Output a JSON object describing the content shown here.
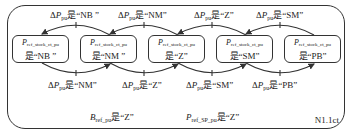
{
  "diagram": {
    "frame_id": "N1.1ct",
    "state_variable": {
      "symbol": "P",
      "subscript": "ref_stock_ct_pu"
    },
    "states": [
      {
        "prefix": "是",
        "value": "“NB ”"
      },
      {
        "prefix": "是",
        "value": "“NM ”"
      },
      {
        "prefix": "是",
        "value": "“Z”"
      },
      {
        "prefix": "是",
        "value": "“SM”"
      },
      {
        "prefix": "是",
        "value": "“PB”"
      }
    ],
    "condition_variable": {
      "delta": "Δ",
      "symbol": "P",
      "subscript": "pu"
    },
    "top_transitions": [
      {
        "from": 1,
        "to": 0,
        "condition": "是“NB ”"
      },
      {
        "from": 2,
        "to": 1,
        "condition": "是“NM”"
      },
      {
        "from": 3,
        "to": 2,
        "condition": "是“Z”"
      },
      {
        "from": 4,
        "to": 3,
        "condition": "是“SM”"
      }
    ],
    "bottom_transitions": [
      {
        "from": 0,
        "to": 1,
        "condition": "是“NM”"
      },
      {
        "from": 1,
        "to": 2,
        "condition": "是“Z”"
      },
      {
        "from": 2,
        "to": 3,
        "condition": "是“SM”"
      },
      {
        "from": 3,
        "to": 4,
        "condition": "是“PB”"
      }
    ],
    "global_conditions": [
      {
        "symbol": "B",
        "subscript": "ref_pu",
        "text": "是“Z”"
      },
      {
        "symbol": "P",
        "subscript": "ref_SP_pu",
        "text": "是“Z”"
      }
    ]
  }
}
